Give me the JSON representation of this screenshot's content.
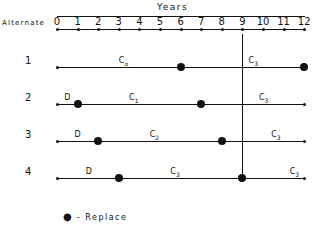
{
  "title": "Years",
  "axis_label": "Alternate",
  "ticks": [
    "0",
    "1",
    "2",
    "3",
    "4",
    "5",
    "6",
    "7",
    "8",
    "9",
    "10",
    "11",
    "12"
  ],
  "rows": [
    {
      "label": "1",
      "replace_years": [
        6,
        12
      ],
      "segments": [
        {
          "text": "C",
          "sub": "o",
          "year": 3.0
        },
        {
          "text": "C",
          "sub": "3",
          "year": 9.3
        }
      ]
    },
    {
      "label": "2",
      "replace_years": [
        1,
        7
      ],
      "segments": [
        {
          "text": "D",
          "sub": "",
          "year": 0.35
        },
        {
          "text": "C",
          "sub": "1",
          "year": 3.5
        },
        {
          "text": "C",
          "sub": "3",
          "year": 9.8
        }
      ]
    },
    {
      "label": "3",
      "replace_years": [
        2,
        8
      ],
      "segments": [
        {
          "text": "D",
          "sub": "",
          "year": 0.85
        },
        {
          "text": "C",
          "sub": "2",
          "year": 4.5
        },
        {
          "text": "C",
          "sub": "3",
          "year": 10.4
        }
      ]
    },
    {
      "label": "4",
      "replace_years": [
        3,
        9
      ],
      "segments": [
        {
          "text": "D",
          "sub": "",
          "year": 1.4
        },
        {
          "text": "C",
          "sub": "3",
          "year": 5.5
        },
        {
          "text": "C",
          "sub": "3",
          "year": 11.3
        }
      ]
    }
  ],
  "vertical_marker_year": 9,
  "legend": {
    "symbol": "●",
    "text": "- Replace"
  },
  "colors": {
    "ink": "#111111",
    "background": "#ffffff"
  }
}
